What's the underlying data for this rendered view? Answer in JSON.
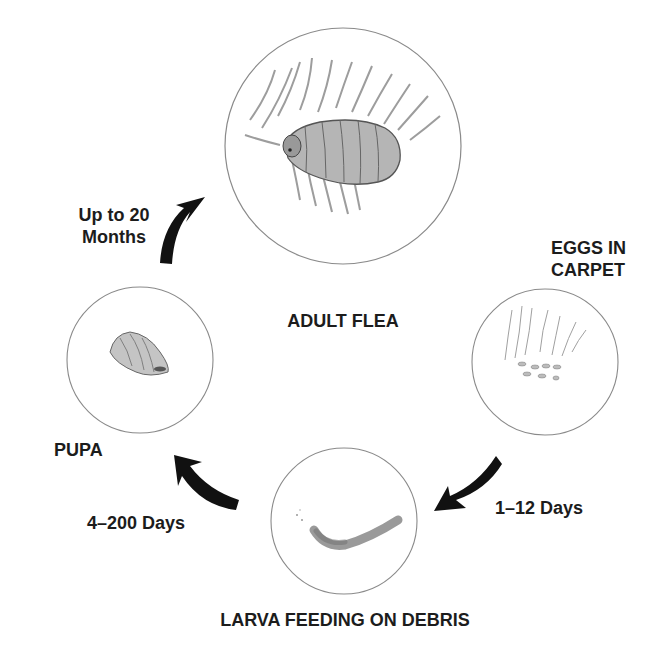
{
  "diagram": {
    "stages": [
      {
        "id": "adult",
        "label": "ADULT FLEA",
        "illustration": "adult-flea-in-hair"
      },
      {
        "id": "eggs",
        "label_line1": "EGGS IN",
        "label_line2": "CARPET",
        "illustration": "eggs-among-carpet-fibers"
      },
      {
        "id": "larva",
        "label": "LARVA FEEDING ON DEBRIS",
        "illustration": "larva-with-debris"
      },
      {
        "id": "pupa",
        "label": "PUPA",
        "illustration": "pupa-cocoon"
      }
    ],
    "transitions": [
      {
        "from": "eggs",
        "to": "larva",
        "duration": "1–12 Days"
      },
      {
        "from": "larva",
        "to": "pupa",
        "duration": "4–200 Days"
      },
      {
        "from": "pupa",
        "to": "adult",
        "duration_line1": "Up to 20",
        "duration_line2": "Months"
      }
    ],
    "colors": {
      "ink": "#1a1a1a",
      "circle_stroke": "#8a8a8a",
      "sketch": "#7a7a7a",
      "background": "#ffffff"
    }
  }
}
